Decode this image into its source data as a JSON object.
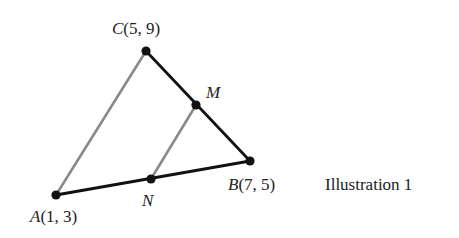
{
  "diagram": {
    "type": "triangle-midsegment",
    "caption": "Illustration 1",
    "points": {
      "A": {
        "name": "A",
        "coords": "(1, 3)",
        "px": [
          56,
          195
        ],
        "label_pos": [
          30,
          222
        ]
      },
      "B": {
        "name": "B",
        "coords": "(7, 5)",
        "px": [
          250,
          161
        ],
        "label_pos": [
          228,
          190
        ]
      },
      "C": {
        "name": "C",
        "coords": "(5, 9)",
        "px": [
          146,
          51
        ],
        "label_pos": [
          112,
          34
        ]
      },
      "M": {
        "name": "M",
        "coords": "",
        "px": [
          196,
          105
        ],
        "label_pos": [
          206,
          98
        ]
      },
      "N": {
        "name": "N",
        "coords": "",
        "px": [
          151,
          179
        ],
        "label_pos": [
          142,
          206
        ]
      }
    },
    "segments": [
      {
        "from": "A",
        "to": "C",
        "color": "#8a8a8a",
        "width": 2.6
      },
      {
        "from": "N",
        "to": "M",
        "color": "#8a8a8a",
        "width": 2.6
      },
      {
        "from": "C",
        "to": "B",
        "color": "#111111",
        "width": 2.8
      },
      {
        "from": "A",
        "to": "B",
        "color": "#111111",
        "width": 2.8
      }
    ],
    "caption_pos": [
      325,
      190
    ],
    "colors": {
      "dark_line": "#111111",
      "gray_line": "#8a8a8a",
      "point": "#111111",
      "text": "#222222"
    }
  }
}
